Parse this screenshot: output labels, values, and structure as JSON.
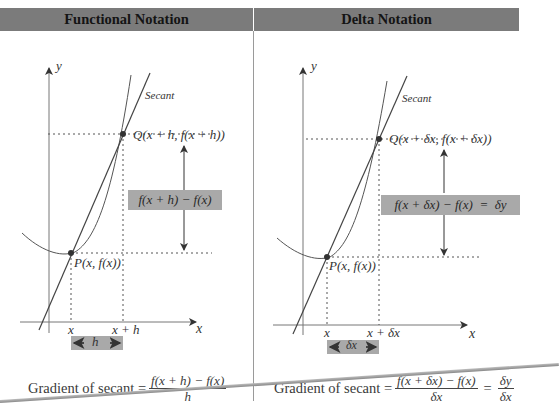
{
  "panels": [
    {
      "id": "functional",
      "header": "Functional Notation",
      "axis_y_label": "y",
      "axis_x_label": "x",
      "secant_label": "Secant",
      "point_q_label": "Q(x + h, f(x + h))",
      "point_p_label": "P(x, f(x))",
      "difference_box": "f(x + h) − f(x)",
      "tick_x": "x",
      "tick_x_plus": "x + h",
      "interval_label": "h",
      "formula": {
        "prefix": "Gradient of secant =",
        "numerator": "f(x + h) − f(x)",
        "denominator": "h"
      }
    },
    {
      "id": "delta",
      "header": "Delta Notation",
      "axis_y_label": "y",
      "axis_x_label": "x",
      "secant_label": "Secant",
      "point_q_label": "Q(x + δx, f(x + δx))",
      "point_p_label": "P(x, f(x))",
      "difference_box": "f(x + δx) − f(x)  =  δy",
      "tick_x": "x",
      "tick_x_plus": "x + δx",
      "interval_label": "δx",
      "formula": {
        "prefix": "Gradient of secant =",
        "numerator": "f(x + δx) − f(x)",
        "denominator": "δx",
        "equals": "=",
        "numerator2": "δy",
        "denominator2": "δx"
      }
    }
  ],
  "colors": {
    "header_bg": "#7b7b7b",
    "box_bg": "#a9a9a9",
    "line": "#444444"
  }
}
